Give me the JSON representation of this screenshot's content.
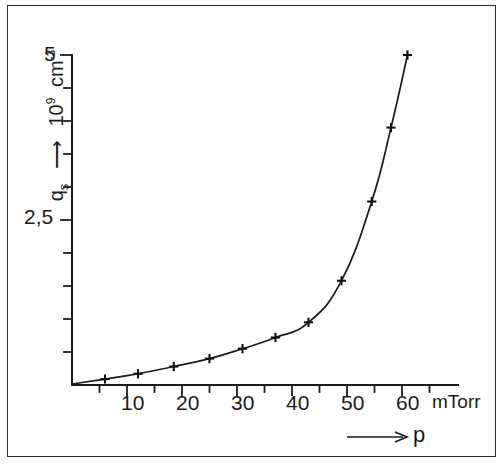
{
  "figure": {
    "background_color": "#ffffff",
    "page_color": "#efefef",
    "frame_color": "#2b2b2b",
    "line_color": "#1b1b1b"
  },
  "axes": {
    "y": {
      "title_symbol": "q",
      "title_subscript": "s",
      "title_arrow": "⟶",
      "title_unit_mantissa": "10",
      "title_unit_exponent": "9",
      "title_unit_rest": "cm",
      "title_unit_rest_exponent": "-3",
      "title_full": "q_s ⟶ 10⁹ cm⁻³",
      "tick_labels": [
        "5",
        "2,5"
      ],
      "tick_label_values": [
        5,
        2.5
      ],
      "minor_tick_count": 10
    },
    "x": {
      "title_arrow": "⟶",
      "title_symbol": "p",
      "unit": "mTorr",
      "tick_labels": [
        "10",
        "20",
        "30",
        "40",
        "50",
        "60"
      ],
      "tick_label_values": [
        10,
        20,
        30,
        40,
        50,
        60
      ]
    }
  },
  "chart_data": {
    "type": "line",
    "title": "",
    "xlabel": "p",
    "ylabel": "q_s",
    "x_unit": "mTorr",
    "y_unit": "10^9 cm^-3",
    "xlim": [
      0,
      66
    ],
    "ylim": [
      0,
      5.6
    ],
    "grid": false,
    "legend": false,
    "marker": "plus",
    "series": [
      {
        "name": "qs vs p",
        "x": [
          6,
          12,
          18.5,
          25,
          31,
          37,
          43,
          49,
          54.5,
          58,
          61
        ],
        "y": [
          0.09,
          0.17,
          0.28,
          0.4,
          0.55,
          0.72,
          0.95,
          1.58,
          2.78,
          3.9,
          5.0
        ]
      }
    ]
  }
}
